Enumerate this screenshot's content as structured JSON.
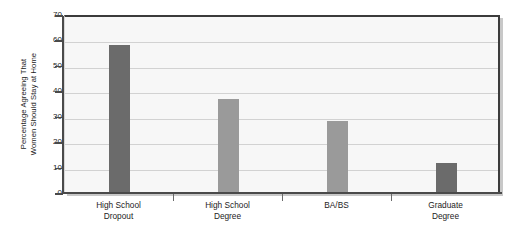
{
  "chart_data": {
    "type": "bar",
    "title": "",
    "xlabel": "",
    "ylabel_lines": [
      "Percentage Agreeing That",
      "Women Should Stay at Home"
    ],
    "ylabel": "Percentage Agreeing That Women Should Stay at Home",
    "categories": [
      "High School Dropout",
      "High School Degree",
      "BA/BS",
      "Graduate Degree"
    ],
    "category_lines": [
      [
        "High School",
        "Dropout"
      ],
      [
        "High School",
        "Degree"
      ],
      [
        "BA/BS",
        ""
      ],
      [
        "Graduate",
        "Degree"
      ]
    ],
    "values": [
      58,
      36.5,
      28,
      11.5
    ],
    "bar_colors": [
      "#6b6b6b",
      "#9a9a9a",
      "#9a9a9a",
      "#6b6b6b"
    ],
    "ylim": [
      0,
      70
    ],
    "ytick_values": [
      0,
      10,
      20,
      30,
      40,
      50,
      60,
      70
    ],
    "ytick_labels": [
      "0",
      "10",
      "20",
      "30",
      "40",
      "50",
      "60",
      "70"
    ],
    "grid": true,
    "grid_axis": "y",
    "legend": "none",
    "plot_background": "#f7f7f7",
    "grid_color": "#d2d2d2",
    "axis_color": "#4a4a4a",
    "frame_color": "#3b3b3b"
  }
}
